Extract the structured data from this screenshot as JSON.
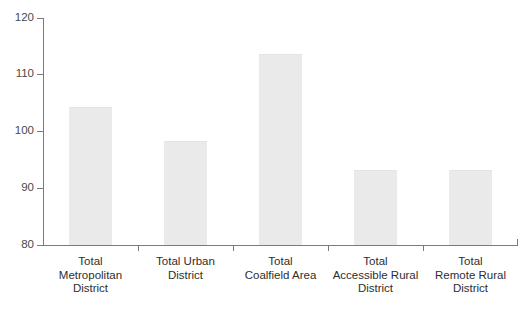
{
  "chart_data": {
    "type": "bar",
    "title": "",
    "subtitle": "",
    "xlabel": "",
    "ylabel": "",
    "ylim": [
      80,
      120
    ],
    "yticks": [
      80,
      90,
      100,
      110,
      120
    ],
    "ytick_labels": [
      "80",
      "90",
      "100",
      "110",
      "120"
    ],
    "grid": false,
    "legend": false,
    "bar_color": "#eaeaea",
    "axis_color": "#7b7b7b",
    "text_color": "#2e2e2e",
    "categories": [
      "Total\nMetropolitan\nDistrict",
      "Total Urban\nDistrict",
      "Total\nCoalfield Area",
      "Total\nAccessible Rural\nDistrict",
      "Total\nRemote Rural\nDistrict"
    ],
    "values": [
      104.3,
      98.4,
      113.6,
      93.2,
      93.2
    ]
  }
}
